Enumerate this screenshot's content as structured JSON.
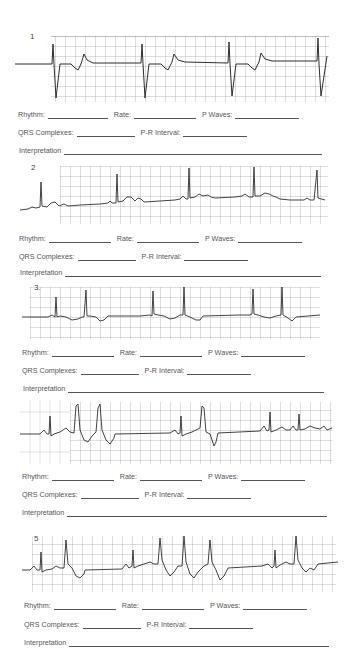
{
  "worksheet": {
    "labels": {
      "rhythm": "Rhythm:",
      "rate": "Rate:",
      "p_waves": "P Waves:",
      "qrs": "QRS Complexes:",
      "pr": "P-R Interval:",
      "interpretation": "Interpretation"
    },
    "strips": [
      {
        "number": "1",
        "answers": {
          "rhythm": "",
          "rate": "",
          "p_waves": "",
          "qrs": "",
          "pr": "",
          "interpretation": ""
        }
      },
      {
        "number": "2",
        "answers": {
          "rhythm": "",
          "rate": "",
          "p_waves": "",
          "qrs": "",
          "pr": "",
          "interpretation": ""
        }
      },
      {
        "number": "3.",
        "answers": {
          "rhythm": "",
          "rate": "",
          "p_waves": "",
          "qrs": "",
          "pr": "",
          "interpretation": ""
        }
      },
      {
        "number": "",
        "answers": {
          "rhythm": "",
          "rate": "",
          "p_waves": "",
          "qrs": "",
          "pr": "",
          "interpretation": ""
        }
      },
      {
        "number": "5",
        "answers": {
          "rhythm": "",
          "rate": "",
          "p_waves": "",
          "qrs": "",
          "pr": "",
          "interpretation": ""
        }
      }
    ]
  },
  "colors": {
    "paper": "#ffffff",
    "grid": "#9a9a9a",
    "trace": "#333333",
    "text": "#555555"
  }
}
